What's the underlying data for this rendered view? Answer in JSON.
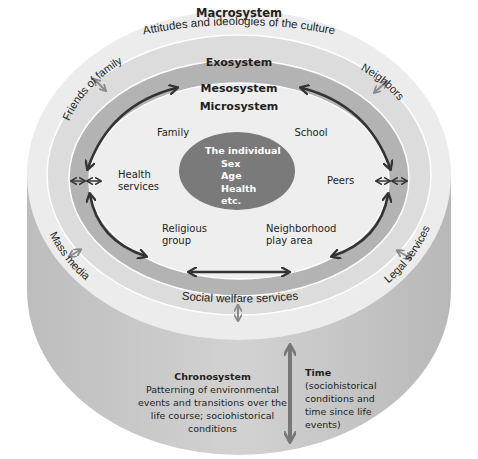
{
  "diagram": {
    "type": "nested-ecological-systems-cylinder",
    "colors": {
      "outer_top": "#ececec",
      "cylinder_side": "#c8c8c8",
      "exosystem_ring": "#dedede",
      "mesosystem_ring": "#b1b1b1",
      "microsystem": "#eeeeee",
      "individual": "#7a7a7a",
      "ring_lines": "#ffffff",
      "arrows_dark": "#333333",
      "arrows_light": "#8a8a8a",
      "time_arrow": "#777777"
    },
    "macrosystem": {
      "title": "Macrosystem",
      "subtitle": "Attitudes and ideologies of the culture"
    },
    "exosystem": {
      "title": "Exosystem",
      "items": [
        "Friends of family",
        "Neighbors",
        "Mass media",
        "Legal services",
        "Social welfare services"
      ]
    },
    "mesosystem": {
      "title": "Mesosystem"
    },
    "microsystem": {
      "title": "Microsystem",
      "items": [
        "Family",
        "School",
        "Health services",
        "Peers",
        "Religious group",
        "Neighborhood play area"
      ]
    },
    "individual": {
      "title": "The individual",
      "attributes": [
        "Sex",
        "Age",
        "Health",
        "etc."
      ]
    },
    "chronosystem": {
      "title": "Chronosystem",
      "description": "Patterning of environmental events and transitions over the life course; sociohistorical conditions"
    },
    "time": {
      "title": "Time",
      "description": "(sociohistorical conditions and time since life events)"
    }
  },
  "labels": {
    "macro_title": "Macrosystem",
    "macro_sub": "Attitudes and ideologies of the culture",
    "exo_title": "Exosystem",
    "meso_title": "Mesosystem",
    "micro_title": "Microsystem",
    "friends": "Friends of family",
    "neighbors": "Neighbors",
    "mass_media": "Mass media",
    "legal": "Legal services",
    "social_welfare": "Social welfare services",
    "family": "Family",
    "school": "School",
    "health_1": "Health",
    "health_2": "services",
    "peers": "Peers",
    "religious_1": "Religious",
    "religious_2": "group",
    "neighborhood_1": "Neighborhood",
    "neighborhood_2": "play area",
    "ind_title": "The individual",
    "ind_sex": "Sex",
    "ind_age": "Age",
    "ind_health": "Health",
    "ind_etc": "etc.",
    "chrono_title": "Chronosystem",
    "chrono_1": "Patterning of environmental",
    "chrono_2": "events and transitions over the",
    "chrono_3": "life course; sociohistorical",
    "chrono_4": "conditions",
    "time_title": "Time",
    "time_1": "(sociohistorical",
    "time_2": "conditions and",
    "time_3": "time since life",
    "time_4": "events)"
  }
}
